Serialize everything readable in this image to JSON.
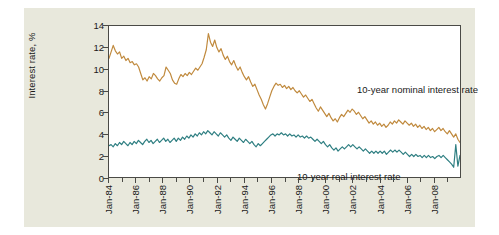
{
  "figure": {
    "background_color": "#ffffff",
    "panel_color": "#e8e8dc",
    "plot_background": "#ffffff",
    "frame_color": "#4a4a46"
  },
  "chart_data": {
    "type": "line",
    "title": "",
    "xlabel": "",
    "ylabel": "Interest rate, %",
    "ylim": [
      0,
      14
    ],
    "yticks": [
      0,
      2,
      4,
      6,
      8,
      10,
      12,
      14
    ],
    "ytick_labels": [
      "0",
      "2",
      "4",
      "6",
      "8",
      "10",
      "12",
      "14"
    ],
    "grid": false,
    "legend": "inline-annotations",
    "xlim": [
      "Jan-84",
      "Dec-09"
    ],
    "xtick_labels": [
      "Jan-84",
      "Jan-86",
      "Jan-88",
      "Jan-90",
      "Jan-92",
      "Jan-94",
      "Jan-96",
      "Jan-98",
      "Jan-00",
      "Jan-02",
      "Jan-04",
      "Jan-06",
      "Jan-08"
    ],
    "annotations": [
      {
        "text": "10-year nominal interest rate",
        "series": "nominal"
      },
      {
        "text": "10-year real interest rate",
        "series": "real"
      }
    ],
    "series": [
      {
        "name": "10-year nominal interest rate",
        "color": "#c08a3e",
        "x_start": "Jan-84",
        "x_step_months": 3,
        "values": [
          11.0,
          11.6,
          12.2,
          11.7,
          11.4,
          11.6,
          11.0,
          11.2,
          10.8,
          11.0,
          10.6,
          10.7,
          10.4,
          10.5,
          10.2,
          9.6,
          9.0,
          9.2,
          8.9,
          9.3,
          9.1,
          9.6,
          9.4,
          9.1,
          8.9,
          9.2,
          9.4,
          10.2,
          9.9,
          9.6,
          9.0,
          8.7,
          8.6,
          9.1,
          9.5,
          9.3,
          9.6,
          9.4,
          9.7,
          9.5,
          9.8,
          10.1,
          9.9,
          10.2,
          10.5,
          11.1,
          11.8,
          13.3,
          12.5,
          12.1,
          12.7,
          12.0,
          11.6,
          11.9,
          11.3,
          10.9,
          11.2,
          10.7,
          10.4,
          10.8,
          10.3,
          9.9,
          10.2,
          9.7,
          9.3,
          9.0,
          9.3,
          8.8,
          8.4,
          8.6,
          8.1,
          7.6,
          7.2,
          6.7,
          6.3,
          6.8,
          7.4,
          8.0,
          8.4,
          8.7,
          8.5,
          8.6,
          8.3,
          8.5,
          8.2,
          8.4,
          8.1,
          8.3,
          8.0,
          7.8,
          8.0,
          7.7,
          7.4,
          7.6,
          7.3,
          7.0,
          7.2,
          6.8,
          6.4,
          6.1,
          6.5,
          6.2,
          5.9,
          5.6,
          5.9,
          5.5,
          5.2,
          5.4,
          5.1,
          5.5,
          5.8,
          5.6,
          5.9,
          6.2,
          6.0,
          6.3,
          6.1,
          5.8,
          6.0,
          5.7,
          5.4,
          5.6,
          5.3,
          5.0,
          5.2,
          4.9,
          5.1,
          4.8,
          5.0,
          4.7,
          4.9,
          4.6,
          4.8,
          5.1,
          4.9,
          5.2,
          5.0,
          5.3,
          5.1,
          4.9,
          5.2,
          5.0,
          4.8,
          5.0,
          4.7,
          4.9,
          4.6,
          4.8,
          4.5,
          4.7,
          4.4,
          4.6,
          4.3,
          4.5,
          4.2,
          4.4,
          4.6,
          4.3,
          4.5,
          4.2,
          4.0,
          4.3,
          4.0,
          3.7,
          4.0,
          3.5,
          3.2
        ]
      },
      {
        "name": "10-year real interest rate",
        "color": "#2f7f82",
        "x_start": "Jan-84",
        "x_step_months": 3,
        "values": [
          2.9,
          3.0,
          2.8,
          3.1,
          2.9,
          3.2,
          3.0,
          3.3,
          3.1,
          2.9,
          3.2,
          3.0,
          3.3,
          3.1,
          3.4,
          3.2,
          3.0,
          3.3,
          3.5,
          3.2,
          3.4,
          3.1,
          3.3,
          3.5,
          3.2,
          3.4,
          3.6,
          3.3,
          3.5,
          3.2,
          3.4,
          3.6,
          3.3,
          3.6,
          3.4,
          3.7,
          3.5,
          3.8,
          3.6,
          3.9,
          3.7,
          4.0,
          3.8,
          4.1,
          3.9,
          4.2,
          4.0,
          4.3,
          4.1,
          3.9,
          4.2,
          4.0,
          3.8,
          4.1,
          3.9,
          3.7,
          3.9,
          3.6,
          3.4,
          3.7,
          3.5,
          3.3,
          3.6,
          3.4,
          3.2,
          3.5,
          3.3,
          3.1,
          3.3,
          3.0,
          2.8,
          3.1,
          2.9,
          3.1,
          3.3,
          3.5,
          3.7,
          3.9,
          4.0,
          3.8,
          4.0,
          3.9,
          4.1,
          3.9,
          4.0,
          3.8,
          4.0,
          3.8,
          3.9,
          3.7,
          3.9,
          3.7,
          3.8,
          3.6,
          3.8,
          3.6,
          3.7,
          3.5,
          3.3,
          3.5,
          3.3,
          3.1,
          3.3,
          3.0,
          2.8,
          3.0,
          2.7,
          2.5,
          2.7,
          2.4,
          2.6,
          2.8,
          2.6,
          2.8,
          3.0,
          2.8,
          3.0,
          2.8,
          2.6,
          2.8,
          2.6,
          2.4,
          2.6,
          2.4,
          2.2,
          2.4,
          2.2,
          2.4,
          2.2,
          2.4,
          2.2,
          2.4,
          2.1,
          2.3,
          2.5,
          2.3,
          2.5,
          2.3,
          2.5,
          2.3,
          2.1,
          2.3,
          2.1,
          1.9,
          2.1,
          1.9,
          2.1,
          1.9,
          2.0,
          1.8,
          2.0,
          1.8,
          2.0,
          1.8,
          1.9,
          1.7,
          1.9,
          2.0,
          1.8,
          2.0,
          1.8,
          1.6,
          1.4,
          1.2,
          0.9,
          3.0,
          1.0,
          2.0
        ]
      }
    ]
  }
}
